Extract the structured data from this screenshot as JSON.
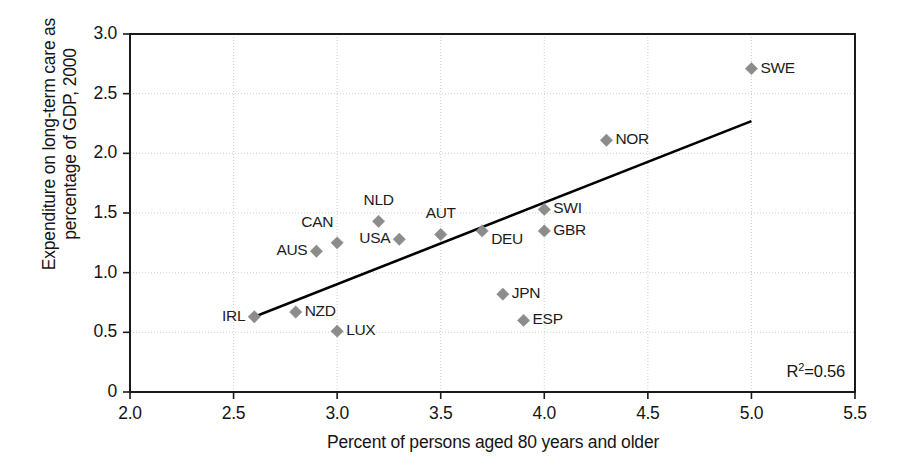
{
  "chart_data": {
    "type": "scatter",
    "title": "",
    "xlabel": "Percent of persons aged 80 years and older",
    "ylabel": "Expenditure on long-term care as\npercentage of GDP, 2000",
    "xlim": [
      2.0,
      5.5
    ],
    "ylim": [
      0,
      3.0
    ],
    "xticks": [
      "2.0",
      "2.5",
      "3.0",
      "3.5",
      "4.0",
      "4.5",
      "5.0",
      "5.5"
    ],
    "xtick_values": [
      2.0,
      2.5,
      3.0,
      3.5,
      4.0,
      4.5,
      5.0,
      5.5
    ],
    "yticks": [
      "0",
      "0.5",
      "1.0",
      "1.5",
      "2.0",
      "2.5",
      "3.0"
    ],
    "ytick_values": [
      0,
      0.5,
      1.0,
      1.5,
      2.0,
      2.5,
      3.0
    ],
    "grid": true,
    "legend": "none",
    "marker_color": "#8c8c8c",
    "line_color": "#000000",
    "annotation": "R2=0.56",
    "r_squared": 0.56,
    "points": [
      {
        "label": "IRL",
        "x": 2.6,
        "y": 0.63,
        "label_pos": "left"
      },
      {
        "label": "NZD",
        "x": 2.8,
        "y": 0.67,
        "label_pos": "right"
      },
      {
        "label": "AUS",
        "x": 2.9,
        "y": 1.18,
        "label_pos": "left"
      },
      {
        "label": "CAN",
        "x": 3.0,
        "y": 1.25,
        "label_pos": "above-left"
      },
      {
        "label": "LUX",
        "x": 3.0,
        "y": 0.51,
        "label_pos": "right"
      },
      {
        "label": "NLD",
        "x": 3.2,
        "y": 1.43,
        "label_pos": "above"
      },
      {
        "label": "USA",
        "x": 3.3,
        "y": 1.28,
        "label_pos": "left"
      },
      {
        "label": "AUT",
        "x": 3.5,
        "y": 1.32,
        "label_pos": "above"
      },
      {
        "label": "DEU",
        "x": 3.7,
        "y": 1.35,
        "label_pos": "below-right"
      },
      {
        "label": "JPN",
        "x": 3.8,
        "y": 0.82,
        "label_pos": "right"
      },
      {
        "label": "ESP",
        "x": 3.9,
        "y": 0.6,
        "label_pos": "right"
      },
      {
        "label": "SWI",
        "x": 4.0,
        "y": 1.53,
        "label_pos": "right"
      },
      {
        "label": "GBR",
        "x": 4.0,
        "y": 1.35,
        "label_pos": "right"
      },
      {
        "label": "NOR",
        "x": 4.3,
        "y": 2.11,
        "label_pos": "right"
      },
      {
        "label": "SWE",
        "x": 5.0,
        "y": 2.71,
        "label_pos": "right"
      }
    ],
    "trendline": {
      "x0": 2.6,
      "y0": 0.63,
      "x1": 5.0,
      "y1": 2.27
    }
  }
}
